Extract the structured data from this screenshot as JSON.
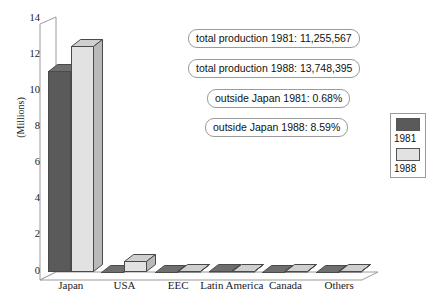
{
  "chart_data": {
    "type": "bar",
    "title": "",
    "xlabel": "",
    "ylabel": "(Millions)",
    "ylim": [
      0,
      14
    ],
    "ytick_labels": [
      "14",
      "12",
      "10",
      "8",
      "6",
      "4",
      "2",
      "0"
    ],
    "ytick_values": [
      14,
      12,
      10,
      8,
      6,
      4,
      2,
      0
    ],
    "grid": false,
    "legend_position": "right-outside",
    "categories": [
      "Japan",
      "USA",
      "EEC",
      "Latin America",
      "Canada",
      "Others"
    ],
    "series": [
      {
        "name": "1981",
        "color": "#5a5a5a",
        "values": [
          11.18,
          0.0,
          0.02,
          0.03,
          0.02,
          0.02
        ]
      },
      {
        "name": "1988",
        "color": "#e2e2e2",
        "values": [
          12.57,
          0.63,
          0.04,
          0.05,
          0.05,
          0.05
        ]
      }
    ],
    "annotations": [
      "total production 1981: 11,255,567",
      "total production 1988: 13,748,395",
      "outside Japan 1981: 0.68%",
      "outside Japan 1988: 8.59%"
    ]
  },
  "legend": {
    "items": [
      {
        "label": "1981",
        "swatch_color": "#5a5a5a"
      },
      {
        "label": "1988",
        "swatch_color": "#e2e2e2"
      }
    ]
  }
}
